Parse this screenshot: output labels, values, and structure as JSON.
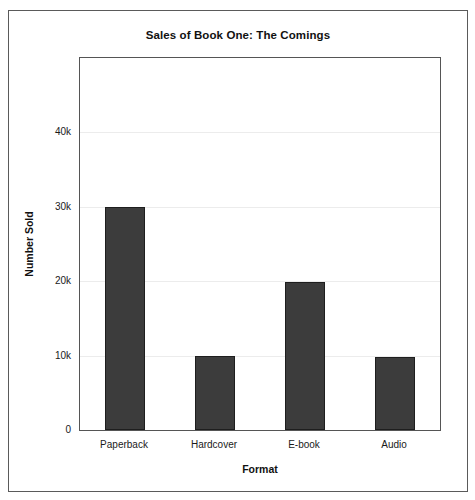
{
  "chart_data": {
    "type": "bar",
    "title": "Sales of Book One: The Comings",
    "xlabel": "Format",
    "ylabel": "Number Sold",
    "categories": [
      "Paperback",
      "Hardcover",
      "E-book",
      "Audio"
    ],
    "values": [
      30000,
      10000,
      19900,
      9800
    ],
    "series": [
      {
        "name": "Number Sold",
        "values": [
          30000,
          10000,
          19900,
          9800
        ]
      }
    ],
    "ylim": [
      0,
      50000
    ],
    "ytick_values": [
      0,
      10000,
      20000,
      30000,
      40000
    ],
    "ytick_labels": [
      "0",
      "10k",
      "20k",
      "30k",
      "40k"
    ],
    "grid": true,
    "grid_axis": "y",
    "legend": false,
    "bar_color": "#3c3c3c",
    "bar_edge_color": "#1e1e1e",
    "grid_color": "#ececec",
    "axis_color": "#555555",
    "background_color": "#ffffff"
  },
  "figure": {
    "border_color": "#5a5a5a"
  }
}
